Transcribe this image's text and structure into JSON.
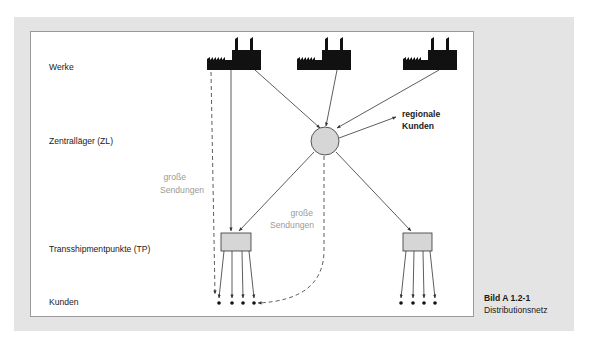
{
  "figure": {
    "caption_number": "Bild A 1.2-1",
    "caption_title": "Distributionsnetz"
  },
  "levels": [
    {
      "id": "werke",
      "label": "Werke"
    },
    {
      "id": "zentrallager",
      "label": "Zentralläger (ZL)"
    },
    {
      "id": "tp",
      "label": "Transshipmentpunkte (TP)"
    },
    {
      "id": "kunden",
      "label": "Kunden"
    }
  ],
  "annotations": {
    "regional_line1": "regionale",
    "regional_line2": "Kunden",
    "large_left_line1": "große",
    "large_left_line2": "Sendungen",
    "large_mid_line1": "große",
    "large_mid_line2": "Sendungen"
  },
  "nodes": {
    "factories": [
      "Werk 1",
      "Werk 2",
      "Werk 3"
    ],
    "central_warehouse": "ZL",
    "transshipment_points": [
      "TP 1",
      "TP 2"
    ],
    "customers_per_tp": 4
  },
  "colors": {
    "panel": "#e4e4e4",
    "node_fill": "#d6d6d6",
    "line": "#333333",
    "gray_text": "#9a9a9a"
  }
}
